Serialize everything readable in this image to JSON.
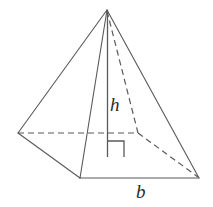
{
  "figure": {
    "name": "square-pyramid-with-height-and-base",
    "labels": {
      "height": "h",
      "base": "b"
    },
    "colors": {
      "stroke": "#59595b",
      "stroke_dark": "#3a3a3c",
      "label": "#2b2b2b",
      "background": "#ffffff"
    },
    "stroke_width": 1.1,
    "dash_pattern": "6 4",
    "vertices": {
      "apex": [
        107,
        10
      ],
      "back_left": [
        18,
        133
      ],
      "back_right": [
        138,
        133
      ],
      "front_left": [
        80,
        178
      ],
      "front_right": [
        199,
        178
      ],
      "height_foot": [
        107,
        157
      ]
    },
    "edges": [
      {
        "name": "apex-to-back-left",
        "from": "apex",
        "to": "back_left",
        "style": "solid"
      },
      {
        "name": "apex-to-front-left",
        "from": "apex",
        "to": "front_left",
        "style": "solid"
      },
      {
        "name": "apex-to-front-right",
        "from": "apex",
        "to": "front_right",
        "style": "solid"
      },
      {
        "name": "back-left-to-front-left",
        "from": "back_left",
        "to": "front_left",
        "style": "solid"
      },
      {
        "name": "front-left-to-front-right",
        "from": "front_left",
        "to": "front_right",
        "style": "solid"
      },
      {
        "name": "apex-to-back-right",
        "from": "apex",
        "to": "back_right",
        "style": "dashed"
      },
      {
        "name": "back-left-to-back-right",
        "from": "back_left",
        "to": "back_right",
        "style": "dashed"
      },
      {
        "name": "back-right-to-front-right",
        "from": "back_right",
        "to": "front_right",
        "style": "dashed"
      }
    ],
    "height_segment": {
      "name": "height-line",
      "from": "apex",
      "to": "height_foot",
      "style": "solid"
    },
    "right_angle_mark": {
      "x": 107,
      "y": 141,
      "size": 16
    }
  }
}
